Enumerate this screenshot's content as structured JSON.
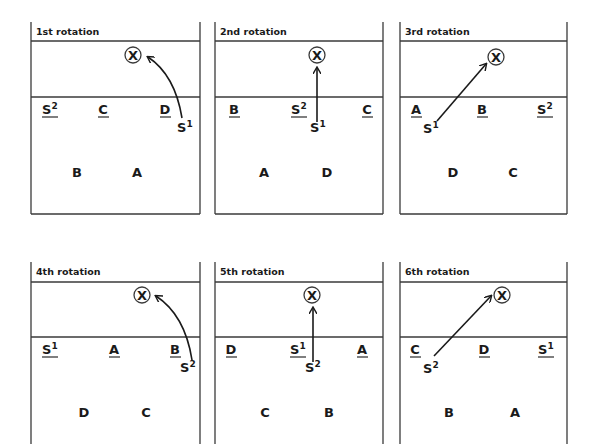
{
  "diagram": {
    "type": "volleyball-serve-receive-rotations",
    "setter_target": "X",
    "panels": [
      {
        "title": "1st rotation",
        "front_row": [
          "S²",
          "C",
          "D"
        ],
        "back_row": [
          "B",
          "A"
        ],
        "penetrating_setter": "S¹",
        "path": "curved"
      },
      {
        "title": "2nd rotation",
        "front_row": [
          "B",
          "S²",
          "C"
        ],
        "back_row": [
          "A",
          "D"
        ],
        "penetrating_setter": "S¹",
        "path": "straight"
      },
      {
        "title": "3rd rotation",
        "front_row": [
          "A",
          "B",
          "S²"
        ],
        "back_row": [
          "D",
          "C"
        ],
        "penetrating_setter": "S¹",
        "path": "diagonal"
      },
      {
        "title": "4th rotation",
        "front_row": [
          "S¹",
          "A",
          "B"
        ],
        "back_row": [
          "D",
          "C"
        ],
        "penetrating_setter": "S²",
        "path": "curved"
      },
      {
        "title": "5th rotation",
        "front_row": [
          "D",
          "S¹",
          "A"
        ],
        "back_row": [
          "C",
          "B"
        ],
        "penetrating_setter": "S²",
        "path": "straight"
      },
      {
        "title": "6th rotation",
        "front_row": [
          "C",
          "D",
          "S¹"
        ],
        "back_row": [
          "B",
          "A"
        ],
        "penetrating_setter": "S²",
        "path": "diagonal"
      }
    ]
  },
  "labels": {
    "p1": {
      "title": "1st rotation",
      "f0": "S",
      "f0s": "2",
      "f1": "C",
      "f2": "D",
      "b0": "B",
      "b1": "A",
      "s": "S",
      "ss": "1",
      "x": "X"
    },
    "p2": {
      "title": "2nd rotation",
      "f0": "B",
      "f1": "S",
      "f1s": "2",
      "f2": "C",
      "b0": "A",
      "b1": "D",
      "s": "S",
      "ss": "1",
      "x": "X"
    },
    "p3": {
      "title": "3rd rotation",
      "f0": "A",
      "f1": "B",
      "f2": "S",
      "f2s": "2",
      "b0": "D",
      "b1": "C",
      "s": "S",
      "ss": "1",
      "x": "X"
    },
    "p4": {
      "title": "4th rotation",
      "f0": "S",
      "f0s": "1",
      "f1": "A",
      "f2": "B",
      "b0": "D",
      "b1": "C",
      "s": "S",
      "ss": "2",
      "x": "X"
    },
    "p5": {
      "title": "5th rotation",
      "f0": "D",
      "f1": "S",
      "f1s": "1",
      "f2": "A",
      "b0": "C",
      "b1": "B",
      "s": "S",
      "ss": "2",
      "x": "X"
    },
    "p6": {
      "title": "6th rotation",
      "f0": "C",
      "f1": "D",
      "f2": "S",
      "f2s": "1",
      "b0": "B",
      "b1": "A",
      "s": "S",
      "ss": "2",
      "x": "X"
    }
  }
}
